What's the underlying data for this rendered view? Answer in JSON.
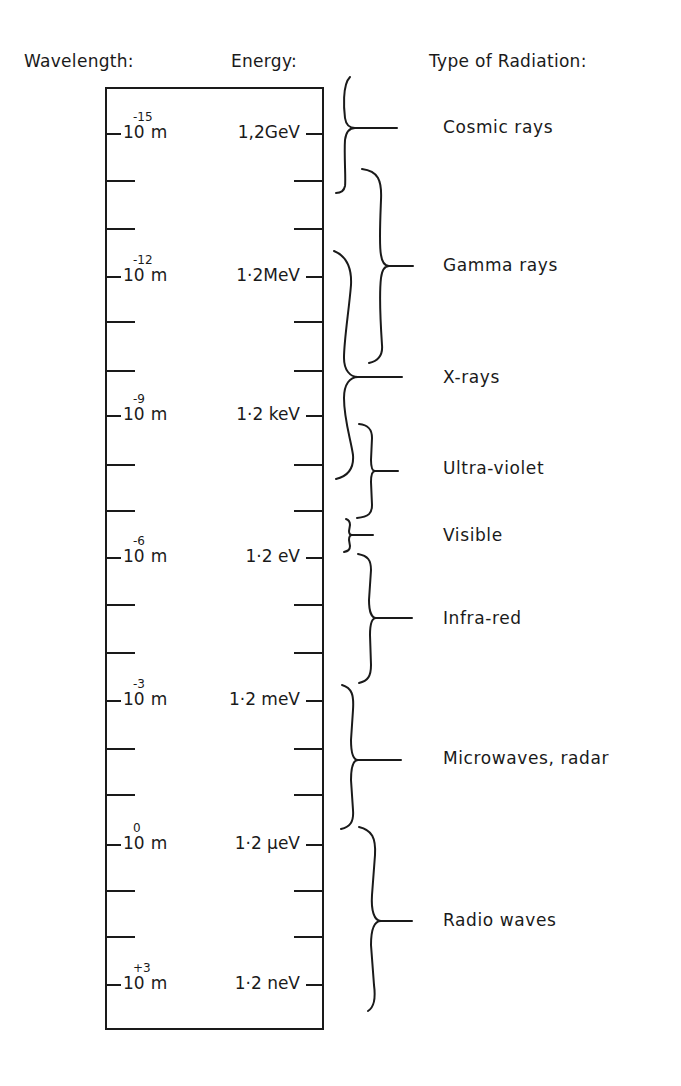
{
  "headers": {
    "wavelength": "Wavelength:",
    "energy": "Energy:",
    "type": "Type of Radiation:"
  },
  "scale": {
    "major": [
      {
        "base": "10",
        "exp": "-15",
        "unit": "m",
        "energy": "1,2GeV"
      },
      {
        "base": "10",
        "exp": "-12",
        "unit": "m",
        "energy": "1·2MeV"
      },
      {
        "base": "10",
        "exp": "-9",
        "unit": "m",
        "energy": "1·2 keV"
      },
      {
        "base": "10",
        "exp": "-6",
        "unit": "m",
        "energy": "1·2 eV"
      },
      {
        "base": "10",
        "exp": "-3",
        "unit": "m",
        "energy": "1·2 meV"
      },
      {
        "base": "10",
        "exp": "0",
        "unit": "m",
        "energy": "1·2 µeV"
      },
      {
        "base": "10",
        "exp": "+3",
        "unit": "m",
        "energy": "1·2 neV"
      }
    ],
    "minor_ticks_between_majors": 2
  },
  "radiation": [
    {
      "name": "Cosmic rays"
    },
    {
      "name": "Gamma rays"
    },
    {
      "name": "X-rays"
    },
    {
      "name": "Ultra-violet"
    },
    {
      "name": "Visible"
    },
    {
      "name": "Infra-red"
    },
    {
      "name": "Microwaves, radar"
    },
    {
      "name": "Radio waves"
    }
  ]
}
